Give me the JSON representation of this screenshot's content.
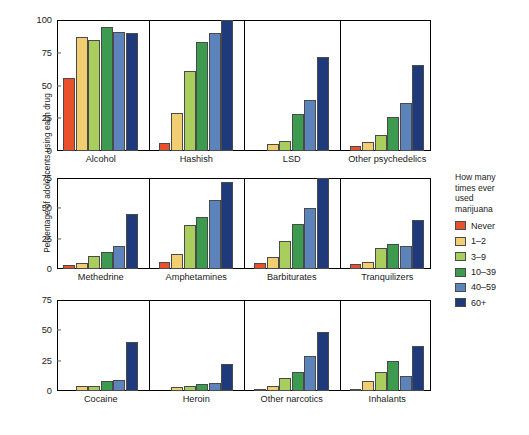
{
  "chart_data": {
    "type": "bar",
    "title": "",
    "xlabel": "",
    "ylabel": "Percentage of adolescents using each drug",
    "grid": false,
    "legend_position": "right",
    "legend_title": "How many times ever used marijuana",
    "series": [
      {
        "name": "Never",
        "color": "#e8512c"
      },
      {
        "name": "1–2",
        "color": "#f2ce72"
      },
      {
        "name": "3–9",
        "color": "#a9ce5e"
      },
      {
        "name": "10–39",
        "color": "#3d9b4f"
      },
      {
        "name": "40–59",
        "color": "#5d83bb"
      },
      {
        "name": "60+",
        "color": "#1e3a7b"
      }
    ],
    "panels": [
      {
        "id": "panel-1",
        "ylim": [
          0,
          100
        ],
        "yticks": [
          0,
          25,
          50,
          75,
          100
        ],
        "categories": [
          "Alcohol",
          "Hashish",
          "LSD",
          "Other psychedelics"
        ],
        "values": [
          [
            56,
            87,
            85,
            95,
            91,
            90
          ],
          [
            6,
            29,
            61,
            83,
            90,
            100
          ],
          [
            0,
            5,
            8,
            28,
            39,
            72
          ],
          [
            4,
            7,
            12,
            26,
            37,
            66
          ]
        ]
      },
      {
        "id": "panel-2",
        "ylim": [
          0,
          75
        ],
        "yticks": [
          0,
          25,
          50,
          75
        ],
        "categories": [
          "Methedrine",
          "Amphetamines",
          "Barbiturates",
          "Tranquilizers"
        ],
        "values": [
          [
            3,
            5,
            11,
            14,
            19,
            45
          ],
          [
            6,
            12,
            36,
            43,
            57,
            72
          ],
          [
            5,
            10,
            23,
            37,
            50,
            75
          ],
          [
            4,
            6,
            17,
            21,
            19,
            40
          ]
        ]
      },
      {
        "id": "panel-3",
        "ylim": [
          0,
          75
        ],
        "yticks": [
          0,
          25,
          50,
          75
        ],
        "categories": [
          "Cocaine",
          "Heroin",
          "Other narcotics",
          "Inhalants"
        ],
        "values": [
          [
            0,
            4,
            4,
            8,
            9,
            40
          ],
          [
            0,
            3,
            4,
            6,
            7,
            22
          ],
          [
            2,
            4,
            11,
            16,
            29,
            49
          ],
          [
            1,
            8,
            16,
            25,
            12,
            37
          ]
        ]
      }
    ]
  },
  "legend": {
    "title_lines": [
      "How many",
      "times ever",
      "used",
      "marijuana"
    ],
    "entries": [
      "Never",
      "1–2",
      "3–9",
      "10–39",
      "40–59",
      "60+"
    ]
  },
  "axis": {
    "ylabel": "Percentage of adolescents using each drug"
  }
}
